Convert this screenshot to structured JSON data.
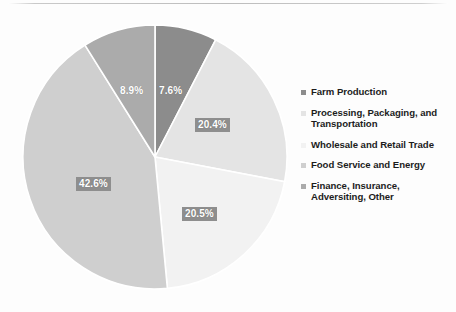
{
  "page": {
    "background_color": "#fdfdfd",
    "rule_color": "#bdbdbd"
  },
  "chart_data": {
    "type": "pie",
    "title": "",
    "subtitle": "",
    "xlabel": "",
    "ylabel": "",
    "legend_position": "right",
    "grid": false,
    "start_angle_deg": 0,
    "direction": "clockwise",
    "categories": [
      "Farm Production",
      "Processing, Packaging, and Transportation",
      "Wholesale and Retail Trade",
      "Food Service and Energy",
      "Finance, Insurance, Adversiting, Other"
    ],
    "values": [
      7.6,
      20.4,
      20.5,
      42.6,
      8.9
    ],
    "value_labels": [
      "7.6%",
      "20.4%",
      "20.5%",
      "42.6%",
      "8.9%"
    ],
    "colors": [
      "#8c8c8c",
      "#e4e4e4",
      "#f2f2f2",
      "#cfcfcf",
      "#ababab"
    ],
    "slice_label_box_color": "#8e8e8e",
    "slice_label_text_color": "#ffffff"
  },
  "slice_labels": {
    "farm": "7.6%",
    "processing": "20.4%",
    "wholesale": "20.5%",
    "foodservice": "42.6%",
    "finance": "8.9%"
  },
  "legend": {
    "items": [
      {
        "label": "Farm Production",
        "color": "#8c8c8c"
      },
      {
        "label": "Processing, Packaging, and Transportation",
        "color": "#e4e4e4"
      },
      {
        "label": "Wholesale and Retail Trade",
        "color": "#f2f2f2"
      },
      {
        "label": "Food Service and Energy",
        "color": "#cfcfcf"
      },
      {
        "label": "Finance, Insurance, Adversiting, Other",
        "color": "#ababab"
      }
    ]
  }
}
